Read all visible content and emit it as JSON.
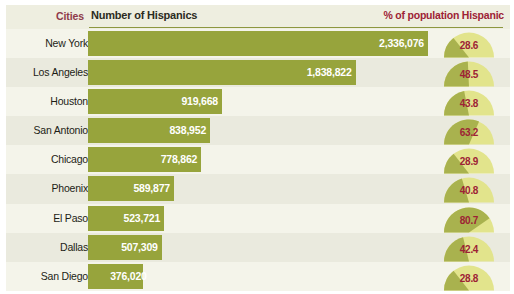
{
  "colors": {
    "panel_bg": "#eeeee0",
    "row_alt_bg": "#f4f4ea",
    "row_base_bg": "#eaeade",
    "bar": "#97a43c",
    "gauge_filled": "#a9b24e",
    "gauge_empty": "#e2e48c",
    "header_rule": "#8d9740",
    "accent_maroon": "#9d2235",
    "cities_label": "#8e3a4a",
    "bar_value_text": "#ffffff"
  },
  "header": {
    "cities_label": "Cities",
    "number_label": "Number of Hispanics",
    "percent_label": "% of population Hispanic"
  },
  "chart_data": {
    "type": "bar",
    "title": "",
    "xlabel": "",
    "ylabel": "",
    "categories": [
      "New York",
      "Los Angeles",
      "Houston",
      "San Antonio",
      "Chicago",
      "Phoenix",
      "El Paso",
      "Dallas",
      "San Diego"
    ],
    "series": [
      {
        "name": "Number of Hispanics",
        "values": [
          2336076,
          1838822,
          919668,
          838952,
          778862,
          589877,
          523721,
          507309,
          376020
        ],
        "labels": [
          "2,336,076",
          "1,838,822",
          "919,668",
          "838,952",
          "778,862",
          "589,877",
          "523,721",
          "507,309",
          "376,020"
        ],
        "xlim": [
          0,
          2336076
        ]
      },
      {
        "name": "% of population Hispanic",
        "values": [
          28.6,
          48.5,
          43.8,
          63.2,
          28.9,
          40.8,
          80.7,
          42.4,
          28.8
        ],
        "labels": [
          "28.6",
          "48.5",
          "43.8",
          "63.2",
          "28.9",
          "40.8",
          "80.7",
          "42.4",
          "28.8"
        ],
        "ylim": [
          0,
          100
        ]
      }
    ],
    "grid": false,
    "legend": "none"
  },
  "rows": [
    {
      "city": "New York",
      "count_label": "2,336,076",
      "count": 2336076,
      "bar_pct": 100.0,
      "pct_label": "28.6",
      "pct": 28.6
    },
    {
      "city": "Los Angeles",
      "count_label": "1,838,822",
      "count": 1838822,
      "bar_pct": 78.7,
      "pct_label": "48.5",
      "pct": 48.5
    },
    {
      "city": "Houston",
      "count_label": "919,668",
      "count": 919668,
      "bar_pct": 39.4,
      "pct_label": "43.8",
      "pct": 43.8
    },
    {
      "city": "San Antonio",
      "count_label": "838,952",
      "count": 838952,
      "bar_pct": 35.9,
      "pct_label": "63.2",
      "pct": 63.2
    },
    {
      "city": "Chicago",
      "count_label": "778,862",
      "count": 778862,
      "bar_pct": 33.3,
      "pct_label": "28.9",
      "pct": 28.9
    },
    {
      "city": "Phoenix",
      "count_label": "589,877",
      "count": 589877,
      "bar_pct": 25.3,
      "pct_label": "40.8",
      "pct": 40.8
    },
    {
      "city": "El Paso",
      "count_label": "523,721",
      "count": 523721,
      "bar_pct": 22.4,
      "pct_label": "80.7",
      "pct": 80.7
    },
    {
      "city": "Dallas",
      "count_label": "507,309",
      "count": 507309,
      "bar_pct": 21.7,
      "pct_label": "42.4",
      "pct": 42.4
    },
    {
      "city": "San Diego",
      "count_label": "376,020",
      "count": 376020,
      "bar_pct": 16.1,
      "pct_label": "28.8",
      "pct": 28.8
    }
  ]
}
